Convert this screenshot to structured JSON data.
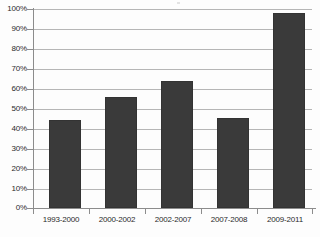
{
  "chart_data": {
    "type": "bar",
    "title": "",
    "xlabel": "",
    "ylabel": "",
    "categories": [
      "1993-2000",
      "2000-2002",
      "2002-2007",
      "2007-2008",
      "2009-2011"
    ],
    "values": [
      44,
      56,
      64,
      45,
      98
    ],
    "value_labels": [
      "44%",
      "56%",
      "64%",
      "45%",
      "98%"
    ],
    "ylim": [
      0,
      100
    ],
    "y_ticks": [
      0,
      10,
      20,
      30,
      40,
      50,
      60,
      70,
      80,
      90,
      100
    ],
    "y_tick_labels": [
      "0%",
      "10%",
      "20%",
      "30%",
      "40%",
      "50%",
      "60%",
      "70%",
      "80%",
      "90%",
      "100%"
    ],
    "grid": true,
    "legend": false,
    "legend_position": "none",
    "series": [
      {
        "name": "",
        "values": [
          44,
          56,
          64,
          45,
          98
        ]
      }
    ],
    "colors": {
      "bar_fill": "#3a3a3a",
      "bar_border": "#333333",
      "gridline": "#b6b6b6",
      "axis": "#8c8c8c",
      "background": "#fdfdfd",
      "label_text": "#2b2b2b"
    }
  }
}
